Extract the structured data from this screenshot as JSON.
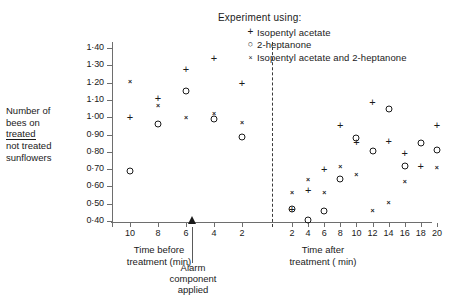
{
  "legend": {
    "title": "Experiment using:",
    "items": [
      {
        "marker": "+",
        "marker_name": "plus",
        "label": "Isopentyl acetate"
      },
      {
        "marker": "○",
        "marker_name": "circle",
        "label": "2-heptanone"
      },
      {
        "marker": "×",
        "marker_name": "cross",
        "label": "Isopentyl acetate and 2-heptanone"
      }
    ]
  },
  "ylabel": {
    "line1": "Number of",
    "line2": "bees on",
    "numerator": "treated",
    "denominator1": "not treated",
    "denominator2": "sunflowers"
  },
  "annotation": {
    "line1": "Alarm",
    "line2": "component",
    "line3": "applied"
  },
  "xtitle_before": {
    "line1": "Time before",
    "line2": "treatment (min)"
  },
  "xtitle_after": {
    "line1": "Time after",
    "line2": "treatment ( min)"
  },
  "chart_data": {
    "type": "scatter",
    "title": "",
    "xlabel": "Time before treatment (min) / Time after treatment (min)",
    "ylabel": "Number of bees on treated / not treated sunflowers",
    "ylim": [
      0.4,
      1.4
    ],
    "ytick_labels": [
      "1·40",
      "1·30",
      "1·20",
      "1·10",
      "1·00",
      "0·90",
      "0·80",
      "0·70",
      "0·60",
      "0·50",
      "0·40"
    ],
    "ytick_values": [
      1.4,
      1.3,
      1.2,
      1.1,
      1.0,
      0.9,
      0.8,
      0.7,
      0.6,
      0.5,
      0.4
    ],
    "grid": false,
    "legend_position": "top-right",
    "xtick_labels_before": [
      "10",
      "8",
      "6",
      "4",
      "2"
    ],
    "xtick_labels_after": [
      "2",
      "4",
      "6",
      "8",
      "10",
      "12",
      "14",
      "16",
      "18",
      "20"
    ],
    "divider_label": "Alarm component applied",
    "series": [
      {
        "name": "Isopentyl acetate",
        "marker": "+",
        "points_before": [
          {
            "x": 10,
            "y": 1.0
          },
          {
            "x": 8,
            "y": 1.11
          },
          {
            "x": 6,
            "y": 1.28
          },
          {
            "x": 4,
            "y": 1.34
          },
          {
            "x": 2,
            "y": 1.2
          }
        ],
        "points_after": [
          {
            "x": 2,
            "y": 0.47
          },
          {
            "x": 4,
            "y": 0.58
          },
          {
            "x": 6,
            "y": 0.7
          },
          {
            "x": 8,
            "y": 0.955
          },
          {
            "x": 10,
            "y": 0.855
          },
          {
            "x": 12,
            "y": 1.09
          },
          {
            "x": 14,
            "y": 0.865
          },
          {
            "x": 16,
            "y": 0.795
          },
          {
            "x": 18,
            "y": 0.72
          },
          {
            "x": 20,
            "y": 0.955
          }
        ]
      },
      {
        "name": "2-heptanone",
        "marker": "○",
        "points_before": [
          {
            "x": 10,
            "y": 0.69
          },
          {
            "x": 8,
            "y": 0.96
          },
          {
            "x": 6,
            "y": 1.15
          },
          {
            "x": 4,
            "y": 0.99
          },
          {
            "x": 2,
            "y": 0.885
          }
        ],
        "points_after": [
          {
            "x": 2,
            "y": 0.47
          },
          {
            "x": 4,
            "y": 0.405
          },
          {
            "x": 6,
            "y": 0.455
          },
          {
            "x": 8,
            "y": 0.645
          },
          {
            "x": 10,
            "y": 0.88
          },
          {
            "x": 12,
            "y": 0.805
          },
          {
            "x": 14,
            "y": 1.05
          },
          {
            "x": 16,
            "y": 0.72
          },
          {
            "x": 18,
            "y": 0.85
          },
          {
            "x": 20,
            "y": 0.81
          }
        ]
      },
      {
        "name": "Isopentyl acetate and 2-heptanone",
        "marker": "×",
        "points_before": [
          {
            "x": 10,
            "y": 1.21
          },
          {
            "x": 8,
            "y": 1.07
          },
          {
            "x": 6,
            "y": 1.0
          },
          {
            "x": 4,
            "y": 1.025
          },
          {
            "x": 2,
            "y": 0.97
          }
        ],
        "points_after": [
          {
            "x": 2,
            "y": 0.57
          },
          {
            "x": 4,
            "y": 0.64
          },
          {
            "x": 6,
            "y": 0.57
          },
          {
            "x": 8,
            "y": 0.72
          },
          {
            "x": 10,
            "y": 0.67
          },
          {
            "x": 12,
            "y": 0.465
          },
          {
            "x": 14,
            "y": 0.51
          },
          {
            "x": 16,
            "y": 0.63
          },
          {
            "x": 20,
            "y": 0.71
          }
        ]
      }
    ]
  }
}
